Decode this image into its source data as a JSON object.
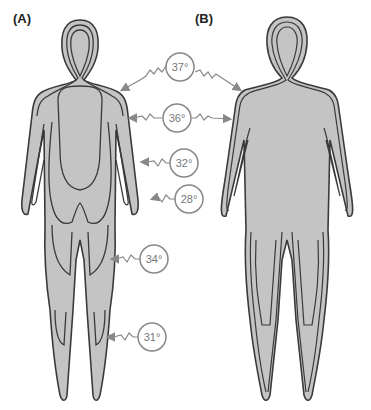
{
  "figure": {
    "panels": [
      {
        "id": "A",
        "label": "(A)"
      },
      {
        "id": "B",
        "label": "(B)"
      }
    ],
    "colors": {
      "body_fill": "#c4c4c4",
      "outline": "#3a3a3a",
      "callout": "#888888",
      "background": "#ffffff"
    },
    "temperature_callouts": [
      {
        "value": "37°",
        "region": "core / shoulder",
        "points_to": [
          "A",
          "B"
        ]
      },
      {
        "value": "36°",
        "region": "upper arm",
        "points_to": [
          "A",
          "B"
        ]
      },
      {
        "value": "32°",
        "region": "forearm",
        "points_to": [
          "A"
        ]
      },
      {
        "value": "28°",
        "region": "hand",
        "points_to": [
          "A"
        ]
      },
      {
        "value": "34°",
        "region": "thigh",
        "points_to": [
          "A"
        ]
      },
      {
        "value": "31°",
        "region": "lower leg",
        "points_to": [
          "A"
        ]
      }
    ]
  }
}
